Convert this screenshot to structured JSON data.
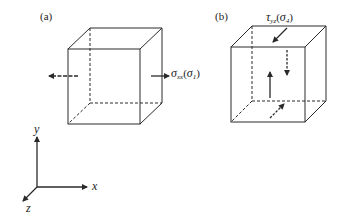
{
  "panels": [
    {
      "id": "a",
      "label": "(a)",
      "stress_symbol": "σ",
      "stress_sub": "xx",
      "alt_symbol": "σ",
      "alt_sub": "1",
      "description": "Normal stress on x-faces"
    },
    {
      "id": "b",
      "label": "(b)",
      "stress_symbol": "τ",
      "stress_sub": "yz",
      "alt_symbol": "σ",
      "alt_sub": "4",
      "description": "Shear stress on y/z faces"
    }
  ],
  "axes": {
    "x": "x",
    "y": "y",
    "z": "z"
  },
  "colors": {
    "line": "#2a2a2a",
    "background": "#ffffff"
  }
}
